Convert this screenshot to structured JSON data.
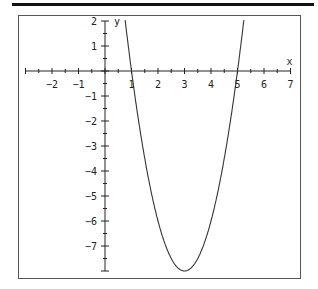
{
  "chart_data": {
    "type": "line",
    "title": "",
    "function": "y = 2(x - 1)(x - 5)",
    "xlabel": "x",
    "ylabel": "y",
    "xlim": [
      -3,
      7
    ],
    "ylim": [
      -8,
      2
    ],
    "x_ticks": [
      -2,
      -1,
      1,
      2,
      3,
      4,
      5,
      6,
      7
    ],
    "y_ticks": [
      2,
      1,
      -1,
      -2,
      -3,
      -4,
      -5,
      -6,
      -7
    ],
    "grid": false,
    "series": [
      {
        "name": "parabola",
        "x": [
          0.5,
          1,
          1.5,
          2,
          2.5,
          3,
          3.5,
          4,
          4.5,
          5,
          5.5
        ],
        "y": [
          4.5,
          0,
          -3.5,
          -6,
          -7.5,
          -8,
          -7.5,
          -6,
          -3.5,
          0,
          4.5
        ]
      }
    ],
    "roots": [
      1,
      5
    ],
    "vertex": [
      3,
      -8
    ]
  }
}
